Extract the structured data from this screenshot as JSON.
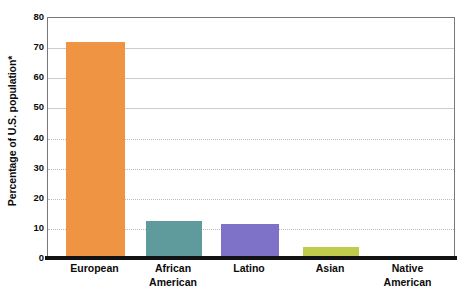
{
  "chart_data": {
    "type": "bar",
    "title": "",
    "subtitle": "",
    "xlabel": "",
    "ylabel": "Percentage of U.S. population*",
    "ylim": [
      0,
      80
    ],
    "ytick_step": 10,
    "yticks": [
      0,
      10,
      20,
      30,
      40,
      50,
      60,
      70,
      80
    ],
    "ytick_labels": [
      "0",
      "10",
      "20",
      "30",
      "40",
      "50",
      "60",
      "70",
      "80"
    ],
    "grid": true,
    "grid_axis": "y",
    "legend": false,
    "legend_position": "none",
    "categories": [
      "European",
      "African American",
      "Latino",
      "Asian",
      "Native American"
    ],
    "category_lines": [
      [
        "European"
      ],
      [
        "African",
        "American"
      ],
      [
        "Latino"
      ],
      [
        "Asian"
      ],
      [
        "Native",
        "American"
      ]
    ],
    "values": [
      72,
      12.5,
      11.5,
      4,
      1
    ],
    "bar_colors": [
      "#ef9442",
      "#5f9a9c",
      "#7d72c8",
      "#c0cc4c",
      "#5a5a5a"
    ],
    "annotations": [
      "*"
    ],
    "footnote_marker": "*"
  },
  "axes": {
    "y_title": "Percentage of U.S. population*",
    "frame_color": "#77797c",
    "baseline_color": "#111214",
    "gridline_color": "#b9bcc0",
    "background": "#ffffff"
  }
}
